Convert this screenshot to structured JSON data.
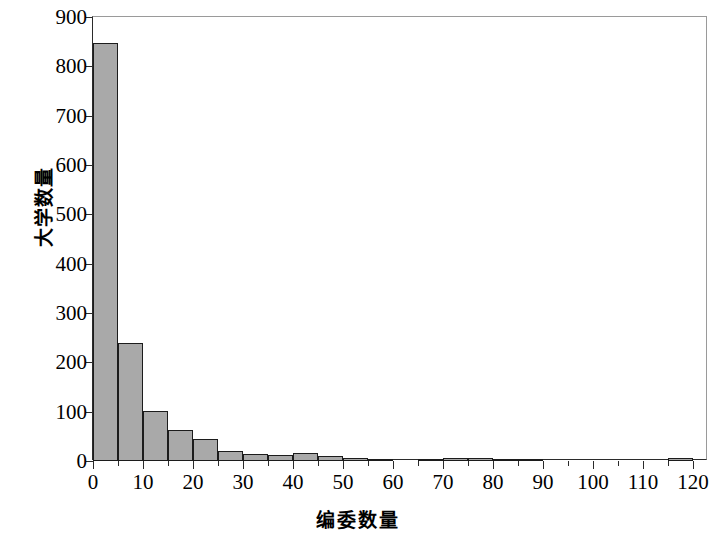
{
  "chart_data": {
    "type": "bar",
    "title": "",
    "subtitle": "",
    "xlabel": "编委数量",
    "ylabel": "大学数量",
    "xlim": [
      0,
      123
    ],
    "ylim": [
      0,
      900
    ],
    "grid": false,
    "legend": null,
    "bin_width": 5,
    "bar_color": "#a9a9a9",
    "bar_edge_color": "#1c1c1c",
    "x_ticks": [
      0,
      10,
      20,
      30,
      40,
      50,
      60,
      70,
      80,
      90,
      100,
      110,
      120
    ],
    "x_tick_labels": [
      "0",
      "10",
      "20",
      "30",
      "40",
      "50",
      "60",
      "70",
      "80",
      "90",
      "100",
      "110",
      "120"
    ],
    "x_minor_ticks": [
      5,
      15,
      25,
      35,
      45,
      55,
      65,
      75,
      85,
      95,
      105,
      115
    ],
    "y_ticks": [
      0,
      100,
      200,
      300,
      400,
      500,
      600,
      700,
      800,
      900
    ],
    "y_tick_labels": [
      "0",
      "100",
      "200",
      "300",
      "400",
      "500",
      "600",
      "700",
      "800",
      "900"
    ],
    "categories": [
      "0-5",
      "5-10",
      "10-15",
      "15-20",
      "20-25",
      "25-30",
      "30-35",
      "35-40",
      "40-45",
      "45-50",
      "50-55",
      "55-60",
      "60-65",
      "65-70",
      "70-75",
      "75-80",
      "80-85",
      "85-90",
      "90-95",
      "95-100",
      "100-105",
      "105-110",
      "110-115",
      "115-120"
    ],
    "bin_starts": [
      0,
      5,
      10,
      15,
      20,
      25,
      30,
      35,
      40,
      45,
      50,
      55,
      60,
      65,
      70,
      75,
      80,
      85,
      90,
      95,
      100,
      105,
      110,
      115
    ],
    "values": [
      848,
      240,
      102,
      63,
      45,
      21,
      15,
      12,
      16,
      10,
      7,
      5,
      0,
      4,
      6,
      6,
      5,
      4,
      0,
      0,
      0,
      0,
      0,
      6
    ]
  }
}
